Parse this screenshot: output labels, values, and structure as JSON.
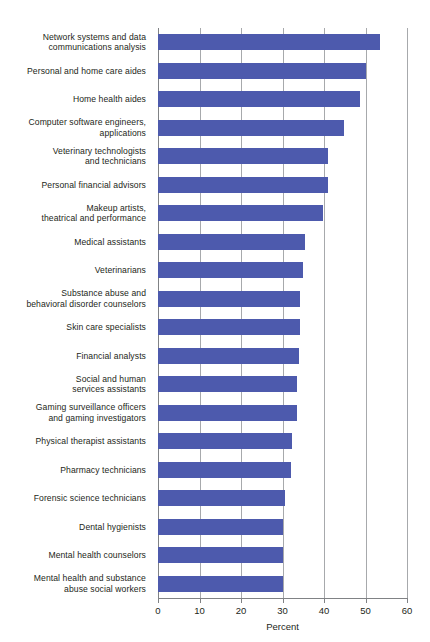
{
  "chart_data": {
    "type": "bar",
    "orientation": "horizontal",
    "title": "",
    "subtitle": "",
    "xlabel": "Percent",
    "ylabel": "",
    "xlim": [
      0,
      60
    ],
    "xticks": [
      0,
      10,
      20,
      30,
      40,
      50,
      60
    ],
    "xtick_labels": [
      "0",
      "10",
      "20",
      "30",
      "40",
      "50",
      "60"
    ],
    "grid": true,
    "grid_axis": "x",
    "legend": false,
    "bar_color": "#4d5aad",
    "gridline_color": "#a7a9ac",
    "axis_color": "#808285",
    "background_color": "#ffffff",
    "categories": [
      "Network systems and data communications analysis",
      "Personal and home care aides",
      "Home health aides",
      "Computer software engineers, applications",
      "Veterinary technologists and technicians",
      "Personal financial advisors",
      "Makeup artists, theatrical and performance",
      "Medical assistants",
      "Veterinarians",
      "Substance abuse and behavioral disorder counselors",
      "Skin care specialists",
      "Financial analysts",
      "Social and human services assistants",
      "Gaming surveillance officers and gaming investigators",
      "Physical therapist assistants",
      "Pharmacy technicians",
      "Forensic science technicians",
      "Dental hygienists",
      "Mental health counselors",
      "Mental health and substance abuse social workers"
    ],
    "category_lines": [
      [
        "Network systems and data",
        "communications analysis"
      ],
      [
        "Personal and home care aides"
      ],
      [
        "Home health aides"
      ],
      [
        "Computer software engineers,",
        "applications"
      ],
      [
        "Veterinary technologists",
        "and technicians"
      ],
      [
        "Personal financial advisors"
      ],
      [
        "Makeup artists,",
        "theatrical and performance"
      ],
      [
        "Medical assistants"
      ],
      [
        "Veterinarians"
      ],
      [
        "Substance abuse and",
        "behavioral disorder counselors"
      ],
      [
        "Skin care specialists"
      ],
      [
        "Financial analysts"
      ],
      [
        "Social and human",
        "services assistants"
      ],
      [
        "Gaming surveillance officers",
        "and gaming investigators"
      ],
      [
        "Physical therapist assistants"
      ],
      [
        "Pharmacy technicians"
      ],
      [
        "Forensic science technicians"
      ],
      [
        "Dental hygienists"
      ],
      [
        "Mental health counselors"
      ],
      [
        "Mental health and substance",
        "abuse social workers"
      ]
    ],
    "values": [
      53.4,
      50.0,
      48.7,
      44.7,
      41.0,
      41.0,
      39.8,
      35.4,
      35.0,
      34.3,
      34.3,
      34.0,
      33.6,
      33.6,
      32.4,
      32.0,
      30.7,
      30.1,
      30.0,
      30.0
    ]
  }
}
